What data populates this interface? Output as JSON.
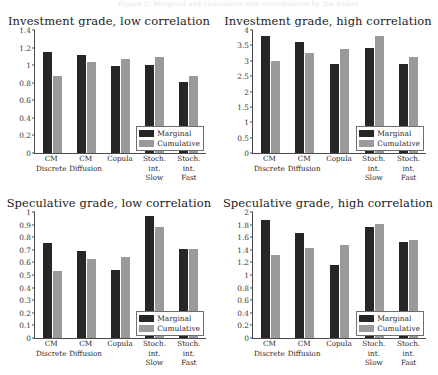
{
  "page": {
    "header_text": "Figure 2: Marginal and cumulative risk contributions by the default volatility"
  },
  "legend": {
    "marginal_label": "Marginal",
    "cumulative_label": "Cumulative",
    "marginal_color": "#262626",
    "cumulative_color": "#9a9a9a"
  },
  "categories": [
    "CM\nDiscrete",
    "CM\nDiffusion",
    "Copula",
    "Stoch. int.\nSlow",
    "Stoch. int.\nFast"
  ],
  "chart_data": [
    {
      "type": "bar",
      "id": "investment-low",
      "title": "Investment grade, low correlation",
      "xlabel": "",
      "ylabel": "",
      "ylim": [
        0,
        1.4
      ],
      "yticks": [
        0,
        0.2,
        0.4,
        0.6,
        0.8,
        1,
        1.2,
        1.4
      ],
      "ytick_labels": [
        "0",
        "0.2",
        "0.4",
        "0.6",
        "0.8",
        "1",
        "1.2",
        "1.4"
      ],
      "grid": false,
      "legend_position": "bottom-right",
      "categories": [
        "CM Discrete",
        "CM Diffusion",
        "Copula",
        "Stoch. int. Slow",
        "Stoch. int. Fast"
      ],
      "series": [
        {
          "name": "Marginal",
          "values": [
            1.145,
            1.11,
            0.99,
            1.005,
            0.805
          ]
        },
        {
          "name": "Cumulative",
          "values": [
            0.875,
            1.035,
            1.07,
            1.09,
            0.88
          ]
        }
      ]
    },
    {
      "type": "bar",
      "id": "investment-high",
      "title": "Investment grade, high correlation",
      "xlabel": "",
      "ylabel": "",
      "ylim": [
        0,
        4
      ],
      "yticks": [
        0,
        0.5,
        1,
        1.5,
        2,
        2.5,
        3,
        3.5,
        4
      ],
      "ytick_labels": [
        "0",
        "0.5",
        "1",
        "1.5",
        "2",
        "2.5",
        "3",
        "3.5",
        "4"
      ],
      "grid": false,
      "legend_position": "bottom-right",
      "categories": [
        "CM Discrete",
        "CM Diffusion",
        "Copula",
        "Stoch. int. Slow",
        "Stoch. int. Fast"
      ],
      "series": [
        {
          "name": "Marginal",
          "values": [
            3.81,
            3.61,
            2.88,
            3.41,
            2.89
          ]
        },
        {
          "name": "Cumulative",
          "values": [
            2.99,
            3.24,
            3.39,
            3.8,
            3.12
          ]
        }
      ]
    },
    {
      "type": "bar",
      "id": "speculative-low",
      "title": "Speculative grade, low correlation",
      "xlabel": "",
      "ylabel": "",
      "ylim": [
        0,
        1
      ],
      "yticks": [
        0,
        0.1,
        0.2,
        0.3,
        0.4,
        0.5,
        0.6,
        0.7,
        0.8,
        0.9,
        1
      ],
      "ytick_labels": [
        "0",
        "0.1",
        "0.2",
        "0.3",
        "0.4",
        "0.5",
        "0.6",
        "0.7",
        "0.8",
        "0.9",
        "1"
      ],
      "grid": false,
      "legend_position": "bottom-right",
      "categories": [
        "CM Discrete",
        "CM Diffusion",
        "Copula",
        "Stoch. int. Slow",
        "Stoch. int. Fast"
      ],
      "series": [
        {
          "name": "Marginal",
          "values": [
            0.755,
            0.69,
            0.54,
            0.968,
            0.705
          ]
        },
        {
          "name": "Cumulative",
          "values": [
            0.53,
            0.625,
            0.645,
            0.885,
            0.705
          ]
        }
      ]
    },
    {
      "type": "bar",
      "id": "speculative-high",
      "title": "Speculative grade, high correlation",
      "xlabel": "",
      "ylabel": "",
      "ylim": [
        0,
        2
      ],
      "yticks": [
        0,
        0.2,
        0.4,
        0.6,
        0.8,
        1,
        1.2,
        1.4,
        1.6,
        1.8,
        2
      ],
      "ytick_labels": [
        "0",
        "0.2",
        "0.4",
        "0.6",
        "0.8",
        "1",
        "1.2",
        "1.4",
        "1.6",
        "1.8",
        "2"
      ],
      "grid": false,
      "legend_position": "bottom-right",
      "categories": [
        "CM Discrete",
        "CM Diffusion",
        "Copula",
        "Stoch. int. Slow",
        "Stoch. int. Fast"
      ],
      "series": [
        {
          "name": "Marginal",
          "values": [
            1.87,
            1.67,
            1.16,
            1.77,
            1.53
          ]
        },
        {
          "name": "Cumulative",
          "values": [
            1.31,
            1.43,
            1.47,
            1.81,
            1.55
          ]
        }
      ]
    }
  ]
}
